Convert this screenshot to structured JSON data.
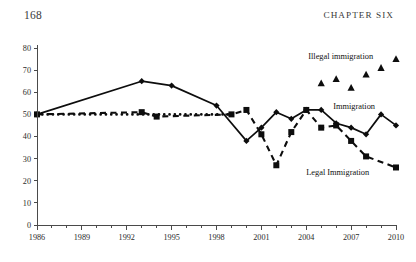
{
  "page": {
    "page_number": "168",
    "chapter_heading": "CHAPTER SIX"
  },
  "chart_data": {
    "type": "line",
    "title": "",
    "xlabel": "",
    "ylabel": "",
    "xlim": [
      1986,
      2010
    ],
    "ylim": [
      0,
      80
    ],
    "grid": false,
    "legend_position": "inline-labels",
    "x_tick_labels": [
      "1986",
      "1989",
      "1992",
      "1995",
      "1998",
      "2001",
      "2004",
      "2007",
      "2010"
    ],
    "x_tick_values": [
      1986,
      1989,
      1992,
      1995,
      1998,
      2001,
      2004,
      2007,
      2010
    ],
    "x_minor_ticks": [
      1986,
      1987,
      1988,
      1989,
      1990,
      1991,
      1992,
      1993,
      1994,
      1995,
      1996,
      1997,
      1998,
      1999,
      2000,
      2001,
      2002,
      2003,
      2004,
      2005,
      2006,
      2007,
      2008,
      2009,
      2010
    ],
    "y_tick_labels": [
      "0",
      "10",
      "20",
      "30",
      "40",
      "50",
      "60",
      "70",
      "80"
    ],
    "y_tick_values": [
      0,
      10,
      20,
      30,
      40,
      50,
      60,
      70,
      80
    ],
    "series": [
      {
        "name": "Immigration",
        "marker": "diamond",
        "linestyle": "solid",
        "label_text": "Immigration",
        "label_x": 2007.2,
        "label_y": 52.5,
        "x": [
          1986,
          1993,
          1995,
          1998,
          2000,
          2001,
          2002,
          2003,
          2004,
          2005,
          2006,
          2007,
          2008,
          2009,
          2010
        ],
        "y": [
          50,
          65,
          63,
          54,
          38,
          44,
          51,
          48,
          52,
          52,
          46,
          44,
          41,
          50,
          45
        ]
      },
      {
        "name": "Legal Immigration",
        "marker": "square",
        "linestyle": "dashed",
        "label_text": "Legal Immigration",
        "label_x": 2006.1,
        "label_y": 22.5,
        "x": [
          1986,
          1993,
          1994,
          1999,
          2000,
          2001,
          2002,
          2003,
          2004,
          2005,
          2006,
          2007,
          2008,
          2010
        ],
        "y": [
          50,
          51,
          49,
          50,
          52,
          41,
          27,
          42,
          52,
          44,
          45,
          38,
          31,
          26
        ]
      },
      {
        "name": "Illegal immigration",
        "marker": "triangle",
        "linestyle": "none",
        "label_text": "Illegal immigration",
        "label_x": 2006.3,
        "label_y": 75.0,
        "x": [
          2005,
          2006,
          2007,
          2008,
          2009,
          2010
        ],
        "y": [
          64,
          66,
          62,
          68,
          71,
          75
        ]
      },
      {
        "name": "Immigration (early dotted)",
        "marker": "none",
        "linestyle": "dotted",
        "label_text": "",
        "x": [
          1986,
          1999
        ],
        "y": [
          50,
          50
        ]
      }
    ]
  }
}
